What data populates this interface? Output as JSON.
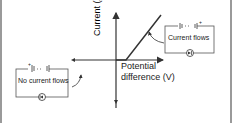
{
  "diagram": {
    "title": "",
    "axes": {
      "y_label": "Current (A)",
      "x_label_line1": "Potential",
      "x_label_line2": "difference (V)"
    },
    "circuits": [
      {
        "position": "right",
        "label": "Current flows",
        "battery_polarity": "+ on right",
        "component": "diode"
      },
      {
        "position": "left",
        "label": "No current flows",
        "battery_polarity": "+ on left",
        "component": "diode"
      }
    ],
    "colors": {
      "line": "#333333",
      "box": "#555555",
      "text": "#222222",
      "border": "#9a9a9a"
    }
  }
}
